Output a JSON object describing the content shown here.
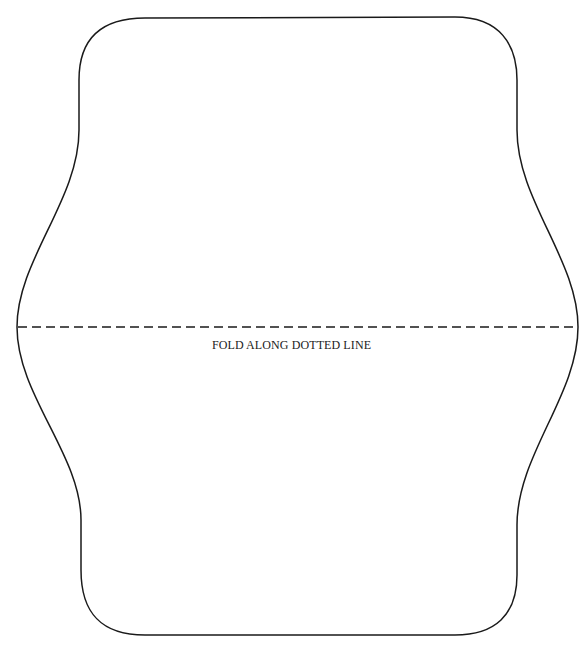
{
  "template": {
    "fold_label": "FOLD ALONG DOTTED LINE",
    "stroke_color": "#1a1a1a",
    "background_color": "#ffffff"
  }
}
